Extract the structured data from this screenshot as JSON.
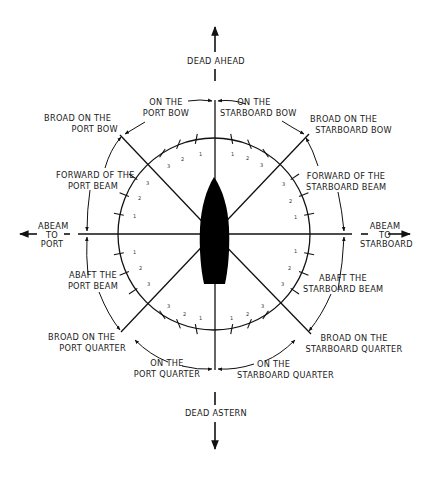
{
  "diagram": {
    "type": "relative bearing diagram",
    "center_object": "ship silhouette (bow pointing up)",
    "colors": {
      "ink": "#111111",
      "background": "#ffffff"
    }
  },
  "directions": {
    "dead_ahead": "DEAD AHEAD",
    "dead_astern": "DEAD ASTERN",
    "abeam_port": {
      "line1": "ABEAM",
      "line2": "TO",
      "line3": "PORT"
    },
    "abeam_starboard": {
      "line1": "ABEAM",
      "line2": "TO",
      "line3": "STARBOARD"
    }
  },
  "sectors": {
    "on_port_bow": {
      "line1": "ON THE",
      "line2": "PORT BOW"
    },
    "on_starboard_bow": {
      "line1": "ON THE",
      "line2": "STARBOARD BOW"
    },
    "broad_port_bow": {
      "line1": "BROAD ON THE",
      "line2": "PORT BOW"
    },
    "broad_starboard_bow": {
      "line1": "BROAD ON THE",
      "line2": "STARBOARD BOW"
    },
    "forward_port_beam": {
      "line1": "FORWARD OF THE",
      "line2": "PORT BEAM"
    },
    "forward_starboard_beam": {
      "line1": "FORWARD OF THE",
      "line2": "STARBOARD BEAM"
    },
    "abaft_port_beam": {
      "line1": "ABAFT THE",
      "line2": "PORT BEAM"
    },
    "abaft_starboard_beam": {
      "line1": "ABAFT THE",
      "line2": "STARBOARD BEAM"
    },
    "broad_port_quarter": {
      "line1": "BROAD ON THE",
      "line2": "PORT QUARTER"
    },
    "broad_starboard_quarter": {
      "line1": "BROAD ON THE",
      "line2": "STARBOARD QUARTER"
    },
    "on_port_quarter": {
      "line1": "ON THE",
      "line2": "PORT QUARTER"
    },
    "on_starboard_quarter": {
      "line1": "ON THE",
      "line2": "STARBOARD QUARTER"
    }
  },
  "point_ticks": {
    "labels": [
      "1",
      "2",
      "3"
    ],
    "description": "Three point marks per octant on inner circle"
  }
}
